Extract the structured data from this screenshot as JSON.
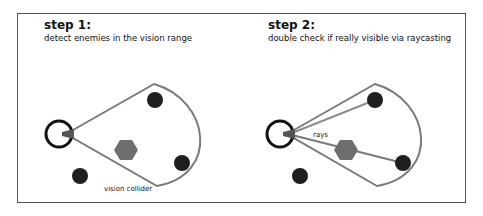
{
  "steps": [
    {
      "title": "step 1:",
      "description": "detect  enemies in the vision range",
      "label": "vision collider"
    },
    {
      "title": "step 2:",
      "description": "double check if really visible via raycasting",
      "label": "rays"
    }
  ],
  "colors": {
    "enemy": "#1f1f1f",
    "obstacle": "#6e6e6e",
    "collider": "#7a7a7a",
    "ray": "#8c8c8c",
    "player": "#111111"
  }
}
